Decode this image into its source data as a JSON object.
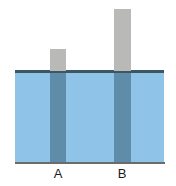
{
  "figure": {
    "name": "buoyancy-rods-in-water-diagram",
    "type": "physics-diagram",
    "colors": {
      "water_fill": "#8fc4e8",
      "water_surface_line": "#3c5763",
      "bottom_line": "#6b6b6b",
      "rod_above_water": "#b9b9b7",
      "rod_below_water": "#5f8da9",
      "background": "#ffffff",
      "label_text": "#1a1a1a"
    },
    "tank": {
      "label": "water tank",
      "left_px": 15,
      "right_px": 164,
      "water_surface_y_px": 71,
      "bottom_y_px": 163,
      "water_depth_px": 92,
      "width_px": 149
    },
    "rods": [
      {
        "label": "A",
        "left_px": 50,
        "right_px": 66,
        "width_px": 16,
        "top_y_px": 49,
        "bottom_y_px": 163,
        "height_above_water_px": 22,
        "height_below_water_px": 92,
        "total_height_px": 114,
        "label_x_px": 58,
        "label_y_px": 166
      },
      {
        "label": "B",
        "left_px": 114,
        "right_px": 131,
        "width_px": 17,
        "top_y_px": 9,
        "bottom_y_px": 163,
        "height_above_water_px": 62,
        "height_below_water_px": 92,
        "total_height_px": 154,
        "label_x_px": 122,
        "label_y_px": 166
      }
    ]
  }
}
